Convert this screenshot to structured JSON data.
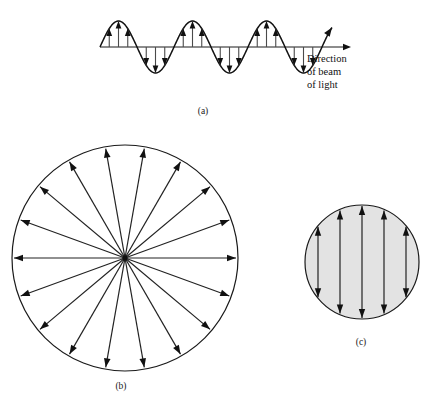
{
  "figure": {
    "background_color": "#ffffff",
    "ink_color": "#111111",
    "width": 442,
    "height": 400
  },
  "panels": [
    {
      "id": "a",
      "caption": "(a)",
      "caption_x": 203,
      "caption_y": 114,
      "description": "Transverse wave travelling to the right with electric field vectors",
      "axis": {
        "x_start": 100,
        "x_end": 345,
        "y": 47,
        "has_arrowhead": true
      },
      "wave": {
        "x_start": 100,
        "x_end": 332,
        "baseline_y": 47,
        "amplitude": 26,
        "cycles": 3,
        "wavelength": 74,
        "end_arrowhead": true
      },
      "field_vectors": {
        "count_per_half_cycle": 3,
        "direction_at_crest": "up",
        "direction_at_trough": "down",
        "relative_lengths": [
          0.55,
          1.0,
          0.62
        ]
      },
      "annotation": {
        "lines": [
          "Direction",
          "of beam",
          "of light"
        ],
        "x": 307,
        "y": 62,
        "line_height": 13
      }
    },
    {
      "id": "b",
      "caption": "(b)",
      "caption_x": 121,
      "caption_y": 389,
      "description": "Unpolarized light: vibrations in all directions perpendicular to the beam",
      "circle": {
        "cx": 125,
        "cy": 258,
        "r": 113,
        "fill": "none",
        "stroke": "#1a1a1a"
      },
      "radial_arrows": {
        "count": 18,
        "angle_step_deg": 20,
        "start_angle_deg": 0,
        "origin": "center",
        "points": "outward"
      }
    },
    {
      "id": "c",
      "caption": "(c)",
      "caption_x": 361,
      "caption_y": 345,
      "description": "Plane-polarized light: vibrations confined to a single vertical plane",
      "circle": {
        "cx": 362,
        "cy": 262,
        "r": 57,
        "fill": "#e3e3e3",
        "stroke": "#1a1a1a"
      },
      "vertical_arrows": {
        "count": 5,
        "double_headed": true,
        "x_offsets": [
          -44,
          -22,
          0,
          22,
          44
        ],
        "spacing": 22
      }
    }
  ],
  "colors": {
    "page_background": "#ffffff",
    "line": "#1a1a1a",
    "arrow": "#111111",
    "shaded_circle_fill": "#e3e3e3",
    "shaft_gray": "#4a4a4a"
  }
}
